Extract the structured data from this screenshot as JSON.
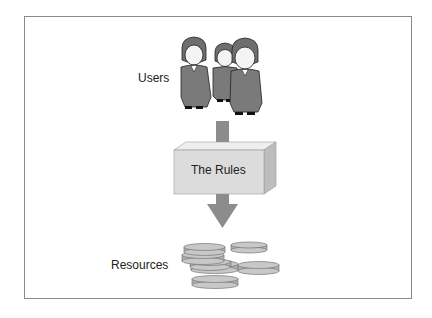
{
  "diagram": {
    "users_label": "Users",
    "rules_label": "The Rules",
    "resources_label": "Resources",
    "colors": {
      "arrow": "#8c8c8c",
      "box_front": "#dcdcdc",
      "box_top": "#efefef",
      "box_side": "#bdbdbd",
      "coin": "#c8c8c8",
      "suit": "#7a7a7a",
      "frame": "#8a8a8a"
    },
    "people_count": 3,
    "coin_count": 7
  }
}
